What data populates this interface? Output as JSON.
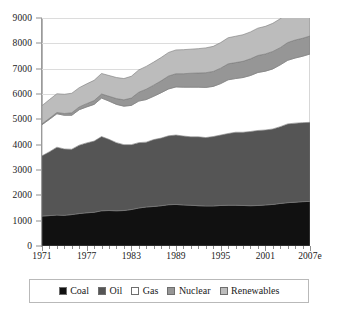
{
  "chart_data": {
    "type": "area",
    "stacked": true,
    "title": "",
    "subtitle": "",
    "xlabel": "",
    "ylabel": "",
    "xlim": [
      1971,
      2007
    ],
    "ylim": [
      0,
      9000
    ],
    "grid": true,
    "legend_position": "bottom",
    "x": [
      1971,
      1972,
      1973,
      1974,
      1975,
      1976,
      1977,
      1978,
      1979,
      1980,
      1981,
      1982,
      1983,
      1984,
      1985,
      1986,
      1987,
      1988,
      1989,
      1990,
      1991,
      1992,
      1993,
      1994,
      1995,
      1996,
      1997,
      1998,
      1999,
      2000,
      2001,
      2002,
      2003,
      2004,
      2005,
      2006,
      2007
    ],
    "x_tick_labels": [
      "1971",
      "1977",
      "1983",
      "1989",
      "1995",
      "2001",
      "2007e"
    ],
    "x_tick_values": [
      1971,
      1977,
      1983,
      1989,
      1995,
      2001,
      2007
    ],
    "y_tick_labels": [
      "0",
      "1000",
      "2000",
      "3000",
      "4000",
      "5000",
      "6000",
      "7000",
      "8000",
      "9000"
    ],
    "y_tick_values": [
      0,
      1000,
      2000,
      3000,
      4000,
      5000,
      6000,
      7000,
      8000,
      9000
    ],
    "series": [
      {
        "name": "Coal",
        "color": "#111111",
        "values": [
          1180,
          1200,
          1220,
          1210,
          1240,
          1280,
          1310,
          1330,
          1390,
          1400,
          1390,
          1400,
          1440,
          1500,
          1540,
          1560,
          1590,
          1630,
          1640,
          1620,
          1610,
          1590,
          1580,
          1580,
          1600,
          1610,
          1610,
          1600,
          1590,
          1600,
          1620,
          1640,
          1680,
          1710,
          1730,
          1750,
          1760
        ]
      },
      {
        "name": "Oil",
        "color": "#555555",
        "values": [
          2380,
          2520,
          2680,
          2620,
          2580,
          2700,
          2760,
          2810,
          2930,
          2810,
          2690,
          2600,
          2560,
          2580,
          2560,
          2640,
          2670,
          2720,
          2740,
          2720,
          2700,
          2720,
          2700,
          2740,
          2780,
          2830,
          2880,
          2890,
          2930,
          2960,
          2960,
          2980,
          3030,
          3110,
          3120,
          3120,
          3120
        ]
      },
      {
        "name": "Gas",
        "color": "#ffffff",
        "values": [
          1230,
          1280,
          1320,
          1330,
          1340,
          1400,
          1420,
          1450,
          1520,
          1510,
          1510,
          1520,
          1550,
          1640,
          1680,
          1710,
          1790,
          1850,
          1900,
          1930,
          1960,
          1960,
          1980,
          1980,
          2030,
          2120,
          2120,
          2160,
          2210,
          2290,
          2320,
          2370,
          2440,
          2510,
          2570,
          2620,
          2700
        ]
      },
      {
        "name": "Nuclear",
        "color": "#969696",
        "values": [
          30,
          40,
          50,
          70,
          100,
          110,
          130,
          150,
          160,
          190,
          230,
          250,
          290,
          350,
          410,
          440,
          470,
          510,
          520,
          530,
          550,
          560,
          580,
          590,
          610,
          630,
          630,
          640,
          660,
          670,
          680,
          690,
          680,
          700,
          710,
          710,
          710
        ]
      },
      {
        "name": "Renewables",
        "color": "#bcbcbc",
        "values": [
          720,
          740,
          740,
          760,
          770,
          760,
          780,
          800,
          810,
          820,
          830,
          840,
          860,
          880,
          900,
          910,
          920,
          930,
          940,
          950,
          950,
          960,
          980,
          990,
          1010,
          1030,
          1040,
          1050,
          1060,
          1080,
          1090,
          1110,
          1140,
          1170,
          1200,
          1230,
          1250
        ]
      }
    ],
    "totals": [
      5540,
      5780,
      6010,
      5990,
      6030,
      6250,
      6400,
      6540,
      6810,
      6730,
      6650,
      6610,
      6700,
      6950,
      7090,
      7260,
      7440,
      7640,
      7740,
      7750,
      7770,
      7790,
      7820,
      7880,
      8030,
      8220,
      8280,
      8340,
      8450,
      8600,
      8670,
      8790,
      8970,
      9200,
      9330,
      9430,
      9540
    ]
  },
  "legend": {
    "items": [
      {
        "label": "Coal",
        "color": "#111111"
      },
      {
        "label": "Oil",
        "color": "#555555"
      },
      {
        "label": "Gas",
        "color": "#ffffff"
      },
      {
        "label": "Nuclear",
        "color": "#969696"
      },
      {
        "label": "Renewables",
        "color": "#bcbcbc"
      }
    ]
  }
}
